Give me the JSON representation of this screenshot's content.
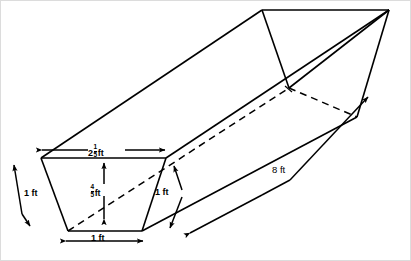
{
  "figure": {
    "background_color": "#ffffff",
    "stroke_color": "#000000",
    "border_color": "#d8d8d8",
    "projection": "oblique 3D prism"
  },
  "labels": {
    "top_width": {
      "text": "2⅕ ft",
      "whole": "2",
      "numerator": "1",
      "denominator": "5",
      "unit": "ft",
      "position": "top edge of front trapezoid"
    },
    "height": {
      "text": "⅘ ft",
      "whole": "",
      "numerator": "4",
      "denominator": "5",
      "unit": "ft",
      "position": "vertical center of front trapezoid"
    },
    "left_slant": {
      "text": "1 ft",
      "position": "left slant edge"
    },
    "right_slant": {
      "text": "1 ft",
      "position": "right slant edge"
    },
    "bottom_width": {
      "text": "1 ft",
      "position": "bottom edge of front trapezoid"
    },
    "length": {
      "text": "8 ft",
      "position": "receding length of trough"
    }
  },
  "dimension_lines": [
    {
      "name": "top-width-dimension",
      "label": "2⅕ ft",
      "arrows": "both"
    },
    {
      "name": "height-dimension",
      "label": "⅘ ft",
      "arrows": "both"
    },
    {
      "name": "left-slant-dimension",
      "label": "1 ft",
      "arrows": "both"
    },
    {
      "name": "right-slant-dimension",
      "label": "1 ft",
      "arrows": "both"
    },
    {
      "name": "bottom-width-dimension",
      "label": "1 ft",
      "arrows": "both"
    },
    {
      "name": "length-dimension",
      "label": "8 ft",
      "arrows": "both"
    }
  ]
}
